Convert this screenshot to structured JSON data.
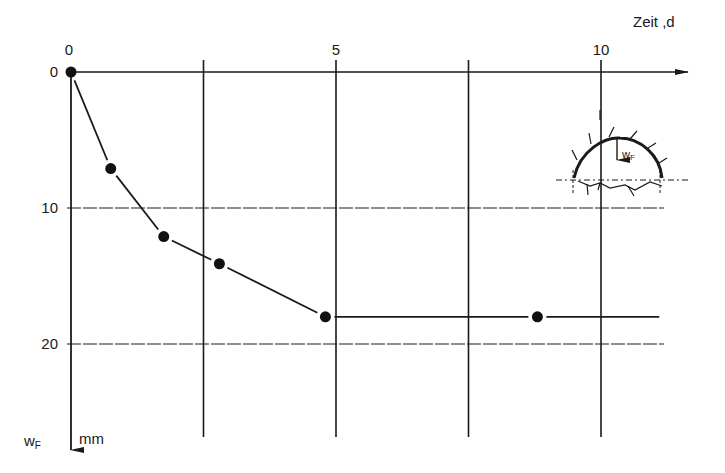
{
  "chart_data": {
    "type": "line",
    "title": "",
    "xlabel": "Zeit ,d",
    "ylabel": "wF mm",
    "ylabel_main": "w",
    "ylabel_sub": "F",
    "ylabel_unit": "mm",
    "xlim": [
      0,
      11.5
    ],
    "ylim": [
      0,
      27
    ],
    "y_inverted": true,
    "x_axis_position": "top",
    "x_ticks": [
      0,
      5,
      10
    ],
    "x_tick_labels": [
      "0",
      "5",
      "10"
    ],
    "x_gridlines": [
      2.5,
      5,
      7.5,
      10
    ],
    "y_ticks": [
      0,
      10,
      20
    ],
    "y_tick_labels": [
      "0",
      "10",
      "20"
    ],
    "y_gridlines": [
      10,
      20
    ],
    "grid": true,
    "legend": null,
    "series": [
      {
        "name": "wF (Firstsetzung)",
        "x": [
          0,
          0.75,
          1.75,
          2.8,
          4.8,
          8.8,
          11.1
        ],
        "y": [
          0,
          7.1,
          12.1,
          14.1,
          18.0,
          18.0,
          18.0
        ],
        "markers": [
          true,
          true,
          true,
          true,
          true,
          true,
          false
        ]
      }
    ],
    "annotations": [
      {
        "type": "inset-diagram",
        "description": "tunnel cross-section with crown settlement arrow",
        "label_main": "w",
        "label_sub": "F"
      }
    ]
  }
}
